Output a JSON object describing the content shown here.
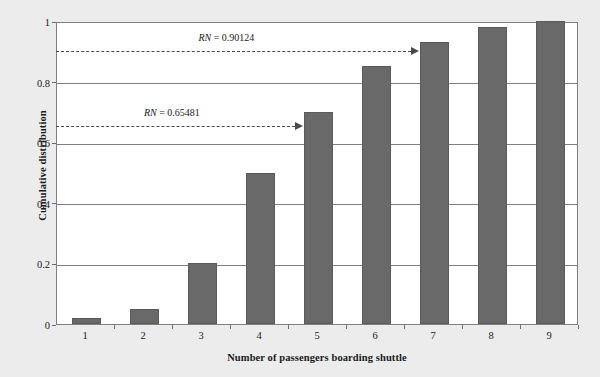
{
  "chart_data": {
    "type": "bar",
    "title": "",
    "categories": [
      "1",
      "2",
      "3",
      "4",
      "5",
      "6",
      "7",
      "8",
      "9"
    ],
    "values": [
      0.02,
      0.05,
      0.2,
      0.5,
      0.7,
      0.85,
      0.93,
      0.98,
      1.0
    ],
    "xlabel": "Number of passengers boarding shuttle",
    "ylabel": "Cumulative distribution",
    "ylim": [
      0,
      1
    ],
    "yticks": [
      "0",
      "0.2",
      "0.4",
      "0.6",
      "0.8",
      "1"
    ],
    "ytick_values": [
      0,
      0.2,
      0.4,
      0.6,
      0.8,
      1
    ],
    "grid": "horizontal",
    "legend": "none",
    "bar_color": "#696969",
    "plot_background": "#ffffff",
    "page_background": "#ececec",
    "axis_color": "#808080",
    "annotations": [
      {
        "name": "RN = 0.90124",
        "symbol": "RN",
        "operator": "=",
        "value": "0.90124",
        "y": 0.90124,
        "points_to_category": "7",
        "style": "dashed-arrow"
      },
      {
        "name": "RN = 0.65481",
        "symbol": "RN",
        "operator": "=",
        "value": "0.65481",
        "y": 0.65481,
        "points_to_category": "5",
        "style": "dashed-arrow"
      }
    ]
  }
}
